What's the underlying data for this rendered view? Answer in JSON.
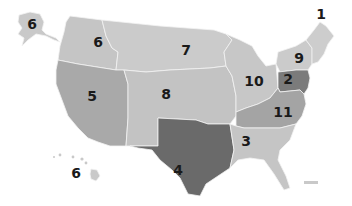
{
  "map": {
    "title": "US regions map",
    "colors": {
      "light": "#c9c9c9",
      "medium": "#a9a9a9",
      "dark": "#7b7b7b",
      "darker": "#6a6a6a",
      "border": "#f2f2f2"
    },
    "regions": [
      {
        "id": "1",
        "label": "1",
        "area": "New England (Maine, NH, VT, MA, RI)",
        "shade": "light",
        "x": 321,
        "y": 14
      },
      {
        "id": "2",
        "label": "2",
        "area": "Pennsylvania / New Jersey / Delaware",
        "shade": "dark",
        "x": 288,
        "y": 79
      },
      {
        "id": "3",
        "label": "3",
        "area": "Southeast (AL, GA, FL, MS, TN, SC)",
        "shade": "light",
        "x": 246,
        "y": 141
      },
      {
        "id": "4",
        "label": "4",
        "area": "South Central (TX, OK, LA, AR)",
        "shade": "darker",
        "x": 178,
        "y": 170
      },
      {
        "id": "5",
        "label": "5",
        "area": "Southwest (CA, NV, AZ, UT)",
        "shade": "medium",
        "x": 92,
        "y": 96
      },
      {
        "id": "6",
        "label": "6",
        "area": "Northwest (WA, OR, ID)",
        "shade": "light",
        "x": 98,
        "y": 42
      },
      {
        "id": "6-ak",
        "label": "6",
        "area": "Alaska",
        "shade": "light",
        "x": 32,
        "y": 24
      },
      {
        "id": "6-hi",
        "label": "6",
        "area": "Hawaii",
        "shade": "light",
        "x": 76,
        "y": 173
      },
      {
        "id": "7",
        "label": "7",
        "area": "North Central (MT, ND, SD, MN, WY)",
        "shade": "light",
        "x": 186,
        "y": 50
      },
      {
        "id": "8",
        "label": "8",
        "area": "Central Plains (CO, NE, KS, IA, MO)",
        "shade": "light",
        "x": 166,
        "y": 94
      },
      {
        "id": "9",
        "label": "9",
        "area": "New York",
        "shade": "light",
        "x": 299,
        "y": 58
      },
      {
        "id": "10",
        "label": "10",
        "area": "Great Lakes (MI, WI, IL, IN, OH)",
        "shade": "light",
        "x": 254,
        "y": 81
      },
      {
        "id": "11",
        "label": "11",
        "area": "Mid-Atlantic (VA, WV, MD, NC, KY)",
        "shade": "medium",
        "x": 283,
        "y": 112
      }
    ]
  }
}
